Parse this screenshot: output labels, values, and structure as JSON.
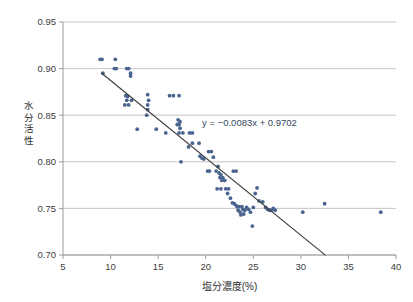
{
  "chart_data": {
    "type": "scatter",
    "title": "",
    "xlabel": "塩分濃度(%)",
    "ylabel": "水分活性",
    "ylabel_chars": [
      "水",
      "分",
      "活",
      "性"
    ],
    "xlim": [
      5,
      40
    ],
    "ylim": [
      0.7,
      0.95
    ],
    "xticks": [
      5,
      10,
      15,
      20,
      25,
      30,
      35,
      40
    ],
    "xtick_labels": [
      "5",
      "10",
      "15",
      "20",
      "25",
      "30",
      "35",
      "40"
    ],
    "yticks": [
      0.7,
      0.75,
      0.8,
      0.85,
      0.9,
      0.95
    ],
    "ytick_labels": [
      "0.70",
      "0.75",
      "0.80",
      "0.85",
      "0.90",
      "0.95"
    ],
    "grid": "horizontal",
    "legend": "none",
    "marker_color": "#4a6490",
    "gridline_color": "#b7b7b7",
    "axis_color": "#9a9a9a",
    "trendline_color": "#3c3a38",
    "annotation": {
      "text": "y = −0.0083x + 0.9702",
      "slope": -0.0083,
      "intercept": 0.9702,
      "x": 24.6,
      "y": 0.838
    },
    "trendline": {
      "x_start": 9.0,
      "y_start": 0.8955,
      "x_end": 32.6,
      "y_end": 0.6996
    },
    "series": [
      {
        "name": "塩分濃度 vs 水分活性",
        "points": [
          [
            8.9,
            0.91
          ],
          [
            9.1,
            0.91
          ],
          [
            9.2,
            0.895
          ],
          [
            10.5,
            0.91
          ],
          [
            10.4,
            0.9
          ],
          [
            10.6,
            0.9
          ],
          [
            11.7,
            0.9
          ],
          [
            11.9,
            0.9
          ],
          [
            12.1,
            0.895
          ],
          [
            12.1,
            0.892
          ],
          [
            11.6,
            0.871
          ],
          [
            11.8,
            0.87
          ],
          [
            11.7,
            0.866
          ],
          [
            11.5,
            0.861
          ],
          [
            11.9,
            0.861
          ],
          [
            12.2,
            0.866
          ],
          [
            13.9,
            0.872
          ],
          [
            14.0,
            0.866
          ],
          [
            13.9,
            0.861
          ],
          [
            13.9,
            0.856
          ],
          [
            13.8,
            0.85
          ],
          [
            12.8,
            0.835
          ],
          [
            14.8,
            0.835
          ],
          [
            15.8,
            0.831
          ],
          [
            16.2,
            0.871
          ],
          [
            16.6,
            0.871
          ],
          [
            17.2,
            0.871
          ],
          [
            17.1,
            0.845
          ],
          [
            17.3,
            0.843
          ],
          [
            17.2,
            0.84
          ],
          [
            17.0,
            0.84
          ],
          [
            17.3,
            0.836
          ],
          [
            17.2,
            0.831
          ],
          [
            17.6,
            0.831
          ],
          [
            18.3,
            0.831
          ],
          [
            18.6,
            0.831
          ],
          [
            17.4,
            0.8
          ],
          [
            18.2,
            0.816
          ],
          [
            18.6,
            0.82
          ],
          [
            19.3,
            0.82
          ],
          [
            19.4,
            0.806
          ],
          [
            19.6,
            0.804
          ],
          [
            19.8,
            0.803
          ],
          [
            20.3,
            0.811
          ],
          [
            20.6,
            0.811
          ],
          [
            20.8,
            0.805
          ],
          [
            20.2,
            0.79
          ],
          [
            20.4,
            0.79
          ],
          [
            21.3,
            0.795
          ],
          [
            21.1,
            0.79
          ],
          [
            21.4,
            0.788
          ],
          [
            21.6,
            0.786
          ],
          [
            21.5,
            0.783
          ],
          [
            21.8,
            0.783
          ],
          [
            21.7,
            0.78
          ],
          [
            22.0,
            0.78
          ],
          [
            22.9,
            0.79
          ],
          [
            23.2,
            0.79
          ],
          [
            21.2,
            0.771
          ],
          [
            21.6,
            0.771
          ],
          [
            22.1,
            0.771
          ],
          [
            22.4,
            0.771
          ],
          [
            22.3,
            0.766
          ],
          [
            22.6,
            0.761
          ],
          [
            22.8,
            0.756
          ],
          [
            23.0,
            0.755
          ],
          [
            23.2,
            0.753
          ],
          [
            23.3,
            0.752
          ],
          [
            23.5,
            0.752
          ],
          [
            23.4,
            0.748
          ],
          [
            23.6,
            0.746
          ],
          [
            23.8,
            0.752
          ],
          [
            23.9,
            0.749
          ],
          [
            24.1,
            0.748
          ],
          [
            24.0,
            0.744
          ],
          [
            23.7,
            0.743
          ],
          [
            24.3,
            0.751
          ],
          [
            24.5,
            0.749
          ],
          [
            24.7,
            0.746
          ],
          [
            25.0,
            0.751
          ],
          [
            25.2,
            0.766
          ],
          [
            25.4,
            0.772
          ],
          [
            25.6,
            0.758
          ],
          [
            26.0,
            0.757
          ],
          [
            26.3,
            0.751
          ],
          [
            26.5,
            0.749
          ],
          [
            26.7,
            0.748
          ],
          [
            26.9,
            0.748
          ],
          [
            27.1,
            0.75
          ],
          [
            27.3,
            0.748
          ],
          [
            24.9,
            0.731
          ],
          [
            30.2,
            0.746
          ],
          [
            32.5,
            0.755
          ],
          [
            38.4,
            0.746
          ]
        ]
      }
    ]
  }
}
